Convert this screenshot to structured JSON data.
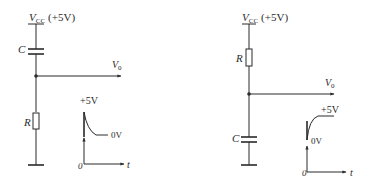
{
  "diagram": {
    "type": "RC circuits",
    "left_circuit": {
      "name": "RC differentiator (C on top, R to ground)",
      "supply_label": "V",
      "supply_subscript": "CC",
      "supply_value": "(+5V)",
      "top_component": "C",
      "bottom_component": "R",
      "output_label": "V",
      "output_subscript": "0",
      "waveform": {
        "shape": "decay",
        "high_label": "+5V",
        "low_label": "0V",
        "origin_label": "0",
        "x_axis_label": "t"
      }
    },
    "right_circuit": {
      "name": "RC integrator (R on top, C to ground)",
      "supply_label": "V",
      "supply_subscript": "CC",
      "supply_value": "(+5V)",
      "top_component": "R",
      "bottom_component": "C",
      "output_label": "V",
      "output_subscript": "0",
      "waveform": {
        "shape": "rise",
        "high_label": "+5V",
        "low_label": "0V",
        "origin_label": "0",
        "x_axis_label": "t"
      }
    },
    "colors": {
      "line": "#2a2a2a",
      "background": "#ffffff"
    }
  }
}
